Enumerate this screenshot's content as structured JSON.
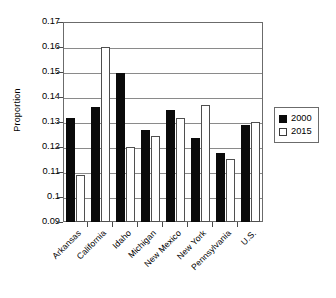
{
  "chart_data": {
    "type": "bar",
    "title": "",
    "xlabel": "",
    "ylabel": "Proportion",
    "ylim": [
      0.09,
      0.17
    ],
    "ytick_step": 0.01,
    "yticks": [
      "0.17",
      "0.16",
      "0.15",
      "0.14",
      "0.13",
      "0.12",
      "0.11",
      "0.1",
      "0.09"
    ],
    "ytick_values": [
      0.17,
      0.16,
      0.15,
      0.14,
      0.13,
      0.12,
      0.11,
      0.1,
      0.09
    ],
    "grid": "horizontal",
    "legend_position": "right",
    "categories": [
      "Arkansas",
      "California",
      "Idaho",
      "Michigan",
      "New Mexico",
      "New York",
      "Pennsylvania",
      "U.S."
    ],
    "series": [
      {
        "name": "2000",
        "color": "#0a0a0a",
        "style": "filled",
        "values": [
          0.1315,
          0.1362,
          0.1495,
          0.127,
          0.135,
          0.1235,
          0.1175,
          0.129
        ]
      },
      {
        "name": "2015",
        "color": "#ffffff",
        "style": "hollow",
        "values": [
          0.109,
          0.16,
          0.12,
          0.1245,
          0.1315,
          0.1368,
          0.1152,
          0.13
        ]
      }
    ]
  },
  "legend": {
    "entries": [
      {
        "label": "2000",
        "swatch": "filled-square-icon"
      },
      {
        "label": "2015",
        "swatch": "hollow-square-icon"
      }
    ]
  }
}
